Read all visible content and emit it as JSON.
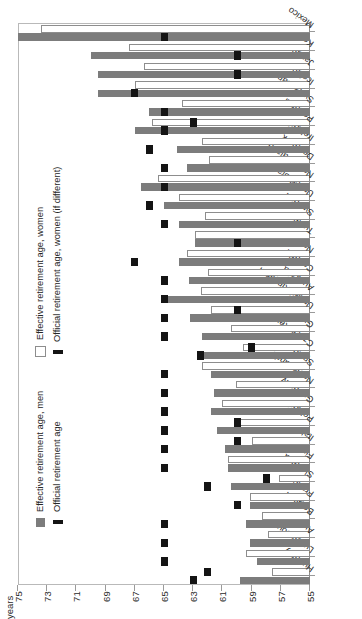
{
  "chart": {
    "axis_unit_label": "years",
    "y_axis": {
      "min": 55,
      "max": 75,
      "ticks": [
        75,
        73,
        71,
        69,
        67,
        65,
        63,
        61,
        59,
        57,
        55
      ]
    },
    "legend_top": {
      "items": [
        {
          "label": "Effective retirement age, women",
          "swatch": "white-square"
        },
        {
          "label": "Official retirement age, women (if different)",
          "swatch": "black-bar"
        }
      ]
    },
    "legend_bottom": {
      "items": [
        {
          "label": "Effective retirement age, men",
          "swatch": "gray-square"
        },
        {
          "label": "Official retirement age",
          "swatch": "black-bar"
        }
      ]
    }
  },
  "chart_data": {
    "type": "bar",
    "title": "",
    "xlabel": "",
    "ylabel": "years",
    "ylim": [
      55,
      75
    ],
    "grid": false,
    "legend_position": "inside-left",
    "orientation": "horizontal-bars-rotated",
    "categories": [
      "Hungary",
      "Luxembourg",
      "Austria",
      "Belgium",
      "France",
      "Slovakia",
      "Finland",
      "Italy",
      "Poland",
      "Germany",
      "Netherlands",
      "Spain",
      "Czech Republic",
      "Greece",
      "United Kingdom",
      "Australia",
      "Canada",
      "Norway",
      "Turkey",
      "Sweden",
      "United States",
      "New Zealand",
      "Denmark",
      "Ireland",
      "Portugal",
      "Switzerland",
      "Iceland",
      "Japan",
      "Korea",
      "Mexico"
    ],
    "series": [
      {
        "name": "Effective retirement age, men",
        "swatch": "gray-square",
        "values": [
          59.8,
          58.6,
          59.1,
          59.4,
          59.1,
          60.4,
          60.6,
          60.8,
          61.4,
          61.8,
          61.6,
          61.8,
          62.3,
          62.4,
          63.2,
          64.8,
          63.3,
          64.0,
          62.9,
          64.0,
          65.0,
          66.6,
          63.4,
          64.1,
          67.0,
          66.0,
          69.5,
          69.5,
          70.0,
          75.0
        ]
      },
      {
        "name": "Effective retirement age, women",
        "swatch": "white-square",
        "values": [
          57.6,
          59.4,
          57.9,
          58.3,
          59.1,
          57.1,
          60.6,
          59.0,
          59.9,
          61.0,
          60.1,
          62.4,
          59.6,
          60.4,
          61.8,
          62.5,
          62.0,
          63.4,
          62.9,
          62.2,
          64.0,
          65.4,
          61.9,
          62.4,
          65.8,
          63.8,
          67.0,
          66.4,
          67.4,
          73.4
        ]
      },
      {
        "name": "Official retirement age (men)",
        "swatch": "black-bar",
        "values": [
          63.0,
          65.0,
          65.0,
          65.0,
          60.0,
          62.0,
          65.0,
          65.0,
          65.0,
          65.0,
          65.0,
          65.0,
          62.5,
          65.0,
          65.0,
          65.0,
          65.0,
          67.0,
          60.0,
          65.0,
          66.0,
          65.0,
          65.0,
          66.0,
          65.0,
          65.0,
          67.0,
          60.0,
          60.0,
          65.0
        ]
      },
      {
        "name": "Official retirement age, women (if different)",
        "swatch": "black-bar",
        "values": [
          62.0,
          null,
          null,
          null,
          null,
          58.0,
          null,
          60.0,
          60.0,
          null,
          null,
          null,
          59.0,
          null,
          60.0,
          null,
          null,
          null,
          null,
          null,
          null,
          null,
          null,
          null,
          63.0,
          null,
          null,
          null,
          null,
          null
        ]
      }
    ]
  }
}
